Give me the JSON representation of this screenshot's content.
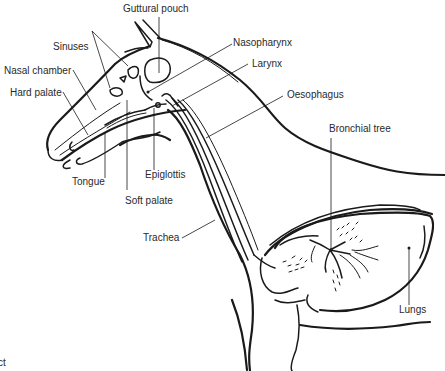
{
  "diagram": {
    "labels": {
      "guttural_pouch": "Guttural pouch",
      "sinuses": "Sinuses",
      "nasal_chamber": "Nasal chamber",
      "hard_palate": "Hard palate",
      "nasopharynx": "Nasopharynx",
      "larynx": "Larynx",
      "oesophagus": "Oesophagus",
      "bronchial_tree": "Bronchial tree",
      "tongue": "Tongue",
      "epiglottis": "Epiglottis",
      "soft_palate": "Soft palate",
      "trachea": "Trachea",
      "lungs": "Lungs"
    },
    "caption_fragment": "ct",
    "colors": {
      "line": "#1a1a1a",
      "text": "#2a2a2a",
      "background": "#ffffff"
    }
  }
}
